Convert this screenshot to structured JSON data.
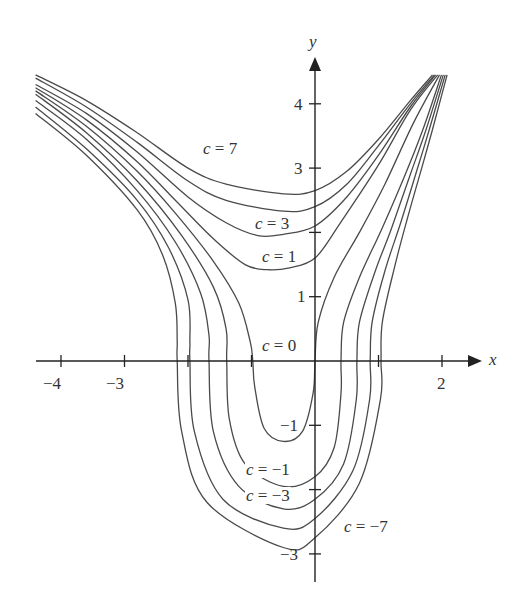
{
  "chart_data": {
    "type": "line",
    "title": "",
    "xlabel": "x",
    "ylabel": "y",
    "xlim": [
      -4.5,
      2.6
    ],
    "ylim": [
      -3.7,
      4.5
    ],
    "grid": false,
    "legend": "none (curves labeled inline)",
    "x_ticks": [
      -4,
      -3,
      -2,
      -1,
      0,
      1,
      2
    ],
    "x_tick_labels": [
      {
        "value": -4,
        "label": "−4"
      },
      {
        "value": -3,
        "label": "−3"
      },
      {
        "value": 2,
        "label": "2"
      }
    ],
    "y_ticks": [
      -3,
      -2,
      -1,
      1,
      2,
      3,
      4
    ],
    "y_tick_labels": [
      {
        "value": 4,
        "label": "4"
      },
      {
        "value": 3,
        "label": "3"
      },
      {
        "value": 1,
        "label": "1"
      },
      {
        "value": -1,
        "label": "−1"
      },
      {
        "value": -3,
        "label": "−3"
      }
    ],
    "series": [
      {
        "name": "c = 7",
        "labeled": true,
        "y_intercept": 2.65,
        "points": [
          [
            -4.4,
            4.45
          ],
          [
            -3.6,
            4.05
          ],
          [
            -2.8,
            3.55
          ],
          [
            -2.0,
            3.0
          ],
          [
            -1.4,
            2.75
          ],
          [
            -0.5,
            2.6
          ],
          [
            0,
            2.65
          ],
          [
            0.5,
            2.95
          ],
          [
            1.0,
            3.45
          ],
          [
            1.5,
            4.05
          ],
          [
            1.85,
            4.45
          ]
        ]
      },
      {
        "name": "c = 5",
        "labeled": false,
        "y_intercept": 2.4,
        "points": [
          [
            -4.4,
            4.4
          ],
          [
            -3.6,
            3.95
          ],
          [
            -2.8,
            3.4
          ],
          [
            -2.0,
            2.8
          ],
          [
            -1.4,
            2.5
          ],
          [
            -0.5,
            2.33
          ],
          [
            0,
            2.4
          ],
          [
            0.5,
            2.75
          ],
          [
            1.0,
            3.35
          ],
          [
            1.5,
            4.0
          ],
          [
            1.88,
            4.45
          ]
        ]
      },
      {
        "name": "c = 3",
        "labeled": true,
        "y_intercept": 2.05,
        "points": [
          [
            -4.4,
            4.3
          ],
          [
            -3.6,
            3.85
          ],
          [
            -2.8,
            3.25
          ],
          [
            -2.0,
            2.55
          ],
          [
            -1.4,
            2.15
          ],
          [
            -0.9,
            1.95
          ],
          [
            -0.5,
            1.97
          ],
          [
            0,
            2.1
          ],
          [
            0.5,
            2.55
          ],
          [
            1.0,
            3.2
          ],
          [
            1.5,
            3.95
          ],
          [
            1.9,
            4.45
          ]
        ]
      },
      {
        "name": "c = 1",
        "labeled": true,
        "y_intercept": 1.6,
        "points": [
          [
            -4.4,
            4.25
          ],
          [
            -3.6,
            3.75
          ],
          [
            -2.8,
            3.1
          ],
          [
            -2.2,
            2.5
          ],
          [
            -1.6,
            1.9
          ],
          [
            -1.1,
            1.5
          ],
          [
            -0.75,
            1.42
          ],
          [
            -0.4,
            1.45
          ],
          [
            0,
            1.6
          ],
          [
            0.4,
            2.15
          ],
          [
            1.0,
            3.05
          ],
          [
            1.5,
            3.9
          ],
          [
            1.93,
            4.45
          ]
        ]
      },
      {
        "name": "c = 0",
        "labeled": true,
        "y_intercept": 0,
        "points_left": [
          [
            -4.4,
            4.2
          ],
          [
            -3.6,
            3.65
          ],
          [
            -2.8,
            2.95
          ],
          [
            -2.2,
            2.3
          ],
          [
            -1.6,
            1.55
          ],
          [
            -1.2,
            0.9
          ],
          [
            -1.02,
            0.3
          ],
          [
            -0.98,
            0
          ],
          [
            -0.95,
            -0.4
          ],
          [
            -0.8,
            -1.05
          ],
          [
            -0.5,
            -1.25
          ],
          [
            -0.2,
            -1.1
          ],
          [
            -0.03,
            -0.5
          ],
          [
            0,
            0
          ]
        ],
        "points_right": [
          [
            0,
            0
          ],
          [
            0.05,
            0.6
          ],
          [
            0.3,
            1.3
          ],
          [
            0.7,
            2.0
          ],
          [
            1.1,
            2.75
          ],
          [
            1.55,
            3.7
          ],
          [
            1.96,
            4.45
          ]
        ]
      },
      {
        "name": "c = -1",
        "labeled": true,
        "y_intercept": -1.8,
        "points_left": [
          [
            -4.4,
            4.15
          ],
          [
            -3.6,
            3.55
          ],
          [
            -2.8,
            2.8
          ],
          [
            -2.1,
            1.95
          ],
          [
            -1.6,
            1.15
          ],
          [
            -1.4,
            0.5
          ],
          [
            -1.39,
            0
          ],
          [
            -1.35,
            -0.9
          ],
          [
            -1.1,
            -1.6
          ],
          [
            -0.5,
            -1.95
          ],
          [
            0,
            -1.8
          ],
          [
            0.3,
            -1.35
          ],
          [
            0.41,
            -0.5
          ],
          [
            0.41,
            0
          ]
        ],
        "points_right": [
          [
            0.41,
            0
          ],
          [
            0.45,
            0.6
          ],
          [
            0.7,
            1.3
          ],
          [
            1.05,
            2.05
          ],
          [
            1.4,
            2.85
          ],
          [
            1.7,
            3.6
          ],
          [
            1.99,
            4.45
          ]
        ]
      },
      {
        "name": "c = -3",
        "labeled": true,
        "y_intercept": -2.1,
        "points_left": [
          [
            -4.4,
            4.05
          ],
          [
            -3.6,
            3.45
          ],
          [
            -2.8,
            2.65
          ],
          [
            -2.2,
            1.85
          ],
          [
            -1.8,
            1.05
          ],
          [
            -1.67,
            0.4
          ],
          [
            -1.67,
            0
          ],
          [
            -1.6,
            -1.1
          ],
          [
            -1.2,
            -1.95
          ],
          [
            -0.5,
            -2.3
          ],
          [
            0,
            -2.15
          ],
          [
            0.45,
            -1.6
          ],
          [
            0.65,
            -0.6
          ],
          [
            0.66,
            0
          ]
        ],
        "points_right": [
          [
            0.66,
            0
          ],
          [
            0.7,
            0.6
          ],
          [
            0.95,
            1.4
          ],
          [
            1.2,
            2.05
          ],
          [
            1.5,
            2.9
          ],
          [
            1.75,
            3.6
          ],
          [
            2.02,
            4.45
          ]
        ]
      },
      {
        "name": "c = -5",
        "labeled": false,
        "y_intercept": -2.45,
        "points_left": [
          [
            -4.4,
            3.95
          ],
          [
            -3.6,
            3.3
          ],
          [
            -2.8,
            2.5
          ],
          [
            -2.3,
            1.75
          ],
          [
            -2.0,
            0.95
          ],
          [
            -1.97,
            0.3
          ],
          [
            -1.97,
            0
          ],
          [
            -1.9,
            -1.1
          ],
          [
            -1.45,
            -2.15
          ],
          [
            -0.5,
            -2.6
          ],
          [
            0,
            -2.45
          ],
          [
            0.6,
            -1.7
          ],
          [
            0.86,
            -0.6
          ],
          [
            0.87,
            0
          ]
        ],
        "points_right": [
          [
            0.87,
            0
          ],
          [
            0.9,
            0.6
          ],
          [
            1.1,
            1.4
          ],
          [
            1.35,
            2.15
          ],
          [
            1.6,
            2.95
          ],
          [
            1.8,
            3.6
          ],
          [
            2.05,
            4.45
          ]
        ]
      },
      {
        "name": "c = -7",
        "labeled": true,
        "y_intercept": -2.75,
        "points_left": [
          [
            -4.4,
            3.85
          ],
          [
            -3.6,
            3.2
          ],
          [
            -2.8,
            2.35
          ],
          [
            -2.4,
            1.65
          ],
          [
            -2.2,
            0.9
          ],
          [
            -2.17,
            0.3
          ],
          [
            -2.17,
            0
          ],
          [
            -2.1,
            -1.1
          ],
          [
            -1.7,
            -2.2
          ],
          [
            -0.5,
            -2.9
          ],
          [
            0,
            -2.75
          ],
          [
            0.7,
            -1.9
          ],
          [
            1.03,
            -0.6
          ],
          [
            1.04,
            0
          ]
        ],
        "points_right": [
          [
            1.04,
            0
          ],
          [
            1.06,
            0.6
          ],
          [
            1.25,
            1.45
          ],
          [
            1.45,
            2.2
          ],
          [
            1.68,
            3.0
          ],
          [
            1.85,
            3.6
          ],
          [
            2.08,
            4.45
          ]
        ]
      }
    ],
    "annotations": [
      {
        "text": "c = 7",
        "x": -1.75,
        "y": 3.1
      },
      {
        "text": "c = 3",
        "x": -0.95,
        "y": 2.05
      },
      {
        "text": "c = 1",
        "x": -0.85,
        "y": 1.55
      },
      {
        "text": "c = 0",
        "x": -0.8,
        "y": 0.35
      },
      {
        "text": "c = −1",
        "x": -0.95,
        "y": -1.85
      },
      {
        "text": "c = −3",
        "x": -0.95,
        "y": -2.25
      },
      {
        "text": "c = −7",
        "x": 0.5,
        "y": -2.75
      }
    ]
  },
  "labels": {
    "x_axis": "x",
    "y_axis": "y",
    "c7": "c = 7",
    "c3": "c = 3",
    "c1": "c = 1",
    "c0": "c = 0",
    "cm1": "c = −1",
    "cm3": "c = −3",
    "cm7": "c = −7",
    "tick_xm4": "−4",
    "tick_xm3": "−3",
    "tick_x2": "2",
    "tick_y4": "4",
    "tick_y3": "3",
    "tick_y1": "1",
    "tick_ym1": "−1",
    "tick_ym3": "−3"
  },
  "colors": {
    "curve": "#4a4a4a",
    "axis": "#222222",
    "background": "#ffffff"
  }
}
